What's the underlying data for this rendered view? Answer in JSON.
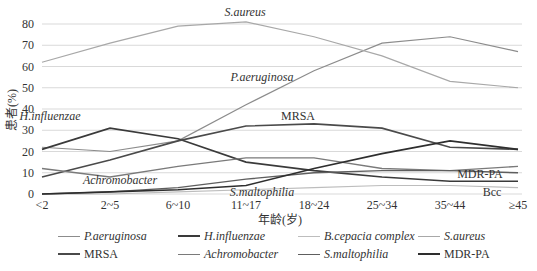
{
  "chart_data": {
    "type": "line",
    "title": "",
    "xlabel": "年龄(岁)",
    "ylabel": "患者(%)",
    "ylim": [
      0,
      80
    ],
    "yticks": [
      0,
      10,
      20,
      30,
      40,
      50,
      60,
      70,
      80
    ],
    "grid": true,
    "legend_position": "bottom",
    "categories": [
      "<2",
      "2~5",
      "6~10",
      "11~17",
      "18~24",
      "25~34",
      "35~44",
      "≥45"
    ],
    "series": [
      {
        "name": "P.aeruginosa",
        "italic": true,
        "color": "#8c8c8c",
        "width": 1.2,
        "values": [
          22,
          20,
          25,
          42,
          58,
          71,
          74,
          67
        ]
      },
      {
        "name": "H.influenzae",
        "italic": true,
        "color": "#3a3a3a",
        "width": 1.6,
        "values": [
          21,
          31,
          26,
          15,
          11,
          8,
          6,
          6
        ]
      },
      {
        "name": "B.cepacia complex",
        "italic": true,
        "color": "#bdbdbd",
        "width": 1.2,
        "values": [
          0,
          0,
          1,
          2,
          3,
          4,
          4,
          3
        ]
      },
      {
        "name": "S.aureus",
        "italic": true,
        "color": "#a8a8a8",
        "width": 1.2,
        "values": [
          62,
          71,
          79,
          81,
          74,
          65,
          53,
          50
        ]
      },
      {
        "name": "MRSA",
        "italic": false,
        "color": "#4a4a4a",
        "width": 1.6,
        "values": [
          8,
          16,
          25,
          32,
          33,
          31,
          22,
          21
        ]
      },
      {
        "name": "Achromobacter",
        "italic": true,
        "color": "#7a7a7a",
        "width": 1.3,
        "values": [
          12,
          8,
          13,
          17,
          17,
          12,
          11,
          13
        ]
      },
      {
        "name": "S.maltophilia",
        "italic": true,
        "color": "#5e5e5e",
        "width": 1.4,
        "values": [
          0,
          1,
          3,
          7,
          10,
          11,
          11,
          10
        ]
      },
      {
        "name": "MDR-PA",
        "italic": false,
        "color": "#2e2e2e",
        "width": 1.6,
        "values": [
          0,
          1,
          2,
          4,
          12,
          19,
          25,
          21
        ]
      }
    ],
    "annotations": [
      {
        "text": "S.aureus",
        "italic": true,
        "x": 245,
        "y": 16
      },
      {
        "text": "P.aeruginosa",
        "italic": true,
        "x": 262,
        "y": 81
      },
      {
        "text": "MRSA",
        "italic": false,
        "x": 298,
        "y": 120
      },
      {
        "text": "H.influenzae",
        "italic": true,
        "x": 50,
        "y": 120
      },
      {
        "text": "Achromobacter",
        "italic": true,
        "x": 120,
        "y": 184
      },
      {
        "text": "S.maltophilia",
        "italic": true,
        "x": 262,
        "y": 196
      },
      {
        "text": "MDR-PA",
        "italic": false,
        "x": 480,
        "y": 178
      },
      {
        "text": "Bcc",
        "italic": false,
        "x": 492,
        "y": 196
      }
    ]
  },
  "axis": {
    "xlabel": "年龄(岁)",
    "ylabel": "患者(%)"
  },
  "legend": {
    "items": [
      {
        "label": "P.aeruginosa",
        "italic": true
      },
      {
        "label": "H.influenzae",
        "italic": true
      },
      {
        "label": "B.cepacia complex",
        "italic": true
      },
      {
        "label": "S.aureus",
        "italic": true
      },
      {
        "label": "MRSA",
        "italic": false
      },
      {
        "label": "Achromobacter",
        "italic": true
      },
      {
        "label": "S.maltophilia",
        "italic": true
      },
      {
        "label": "MDR-PA",
        "italic": false
      }
    ]
  }
}
